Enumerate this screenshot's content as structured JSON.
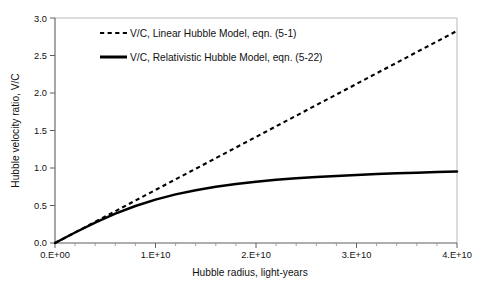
{
  "chart_data": {
    "type": "line",
    "title": "",
    "xlabel": "Hubble radius, light-years",
    "ylabel": "Hubble velocity ratio, V/C",
    "xlim": [
      0,
      40000000000
    ],
    "ylim": [
      0,
      3.0
    ],
    "grid": false,
    "legend_position": "top-center",
    "x_ticks": [
      0,
      10000000000,
      20000000000,
      30000000000,
      40000000000
    ],
    "x_tick_labels": [
      "0.E+00",
      "1.E+10",
      "2.E+10",
      "3.E+10",
      "4.E+10"
    ],
    "y_ticks": [
      0.0,
      0.5,
      1.0,
      1.5,
      2.0,
      2.5,
      3.0
    ],
    "y_tick_labels": [
      "0.0",
      "0.5",
      "1.0",
      "1.5",
      "2.0",
      "2.5",
      "3.0"
    ],
    "x": [
      0,
      2000000000,
      4000000000,
      6000000000,
      8000000000,
      10000000000,
      12000000000,
      14000000000,
      16000000000,
      18000000000,
      20000000000,
      22000000000,
      24000000000,
      26000000000,
      28000000000,
      30000000000,
      32000000000,
      34000000000,
      36000000000,
      38000000000,
      40000000000
    ],
    "series": [
      {
        "name": "V/C, Linear Hubble Model, eqn. (5-1)",
        "style": "dashed",
        "color": "#000000",
        "values": [
          0.0,
          0.141,
          0.283,
          0.424,
          0.566,
          0.707,
          0.849,
          0.99,
          1.131,
          1.273,
          1.414,
          1.556,
          1.697,
          1.839,
          1.98,
          2.121,
          2.263,
          2.404,
          2.546,
          2.687,
          2.828
        ]
      },
      {
        "name": "V/C, Relativistic Hubble Model, eqn. (5-22)",
        "style": "solid",
        "color": "#000000",
        "values": [
          0.0,
          0.14,
          0.272,
          0.391,
          0.493,
          0.578,
          0.648,
          0.704,
          0.75,
          0.787,
          0.817,
          0.842,
          0.863,
          0.88,
          0.895,
          0.908,
          0.919,
          0.929,
          0.938,
          0.946,
          0.953
        ]
      }
    ]
  },
  "legend": {
    "entries": [
      {
        "label": "V/C, Linear Hubble Model, eqn. (5-1)",
        "marker": "dashed-line-swatch"
      },
      {
        "label": "V/C, Relativistic Hubble Model, eqn. (5-22)",
        "marker": "solid-line-swatch"
      }
    ]
  },
  "axes": {
    "x_title": "Hubble radius, light-years",
    "y_title": "Hubble velocity ratio, V/C",
    "x_labels": [
      "0.E+00",
      "1.E+10",
      "2.E+10",
      "3.E+10",
      "4.E+10"
    ],
    "y_labels": [
      "0.0",
      "0.5",
      "1.0",
      "1.5",
      "2.0",
      "2.5",
      "3.0"
    ]
  },
  "colors": {
    "line": "#000000",
    "frame": "#b8b8b8",
    "axis": "#6b6b6b",
    "background": "#ffffff"
  }
}
